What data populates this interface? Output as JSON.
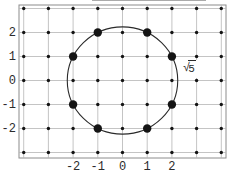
{
  "figure": {
    "background": "#ffffff",
    "colors": {
      "grid": "#b5b5b5",
      "frame": "#8c8c8c",
      "dot": "#141414",
      "circle": "#2a2a2a",
      "label": "#2b2b2b",
      "artifact": "#aaaaaa"
    },
    "grid_range": {
      "x_min": -4,
      "x_max": 4,
      "y_min": -3,
      "y_max": 3
    },
    "x_ticks": [
      -2,
      -1,
      0,
      1,
      2
    ],
    "x_tick_labels": [
      "-2",
      "-1",
      "0",
      "1",
      "2"
    ],
    "y_ticks": [
      2,
      1,
      0,
      -1,
      -2
    ],
    "y_tick_labels": [
      "2",
      "1",
      "0",
      "-1",
      "-2"
    ],
    "lattice_dots": "all integer points in grid_range",
    "highlighted_points": [
      [
        -1,
        2
      ],
      [
        1,
        2
      ],
      [
        -2,
        1
      ],
      [
        2,
        1
      ],
      [
        -2,
        -1
      ],
      [
        2,
        -1
      ],
      [
        -1,
        -2
      ],
      [
        1,
        -2
      ]
    ],
    "circle": {
      "center": [
        0,
        0
      ],
      "radius_value": 2.2360679,
      "radius_label": "√5"
    },
    "radius_label": {
      "radical": "√",
      "radicand": "5"
    }
  }
}
